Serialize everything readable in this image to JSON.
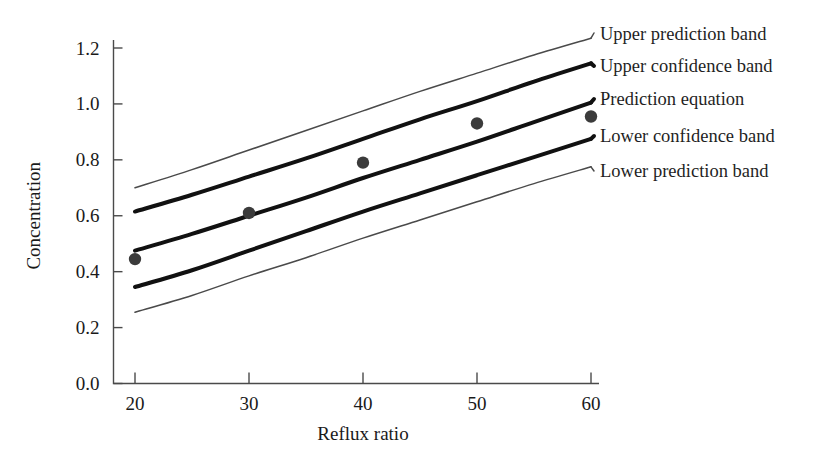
{
  "chart_data": {
    "type": "line",
    "title": "",
    "subtitle": "",
    "xlabel": "Reflux ratio",
    "ylabel": "Concentration",
    "xlim": [
      15,
      63
    ],
    "ylim": [
      0.0,
      1.28
    ],
    "xticks": [
      20,
      30,
      40,
      50,
      60
    ],
    "xtick_labels": [
      "20",
      "30",
      "40",
      "50",
      "60"
    ],
    "yticks": [
      0.0,
      0.2,
      0.4,
      0.6,
      0.8,
      1.0,
      1.2
    ],
    "ytick_labels": [
      "0.0",
      "0.2",
      "0.4",
      "0.6",
      "0.8",
      "1.0",
      "1.2"
    ],
    "grid": false,
    "legend_position": "right-outside",
    "x": [
      20,
      30,
      40,
      50,
      60
    ],
    "series": [
      {
        "name": "Upper prediction band",
        "style": "thin",
        "x": [
          20,
          25,
          30,
          35,
          40,
          45,
          50,
          55,
          60
        ],
        "values": [
          0.7,
          0.765,
          0.835,
          0.905,
          0.975,
          1.045,
          1.11,
          1.175,
          1.235
        ]
      },
      {
        "name": "Upper confidence band",
        "style": "thick",
        "x": [
          20,
          25,
          30,
          35,
          40,
          45,
          50,
          55,
          60
        ],
        "values": [
          0.615,
          0.675,
          0.74,
          0.805,
          0.875,
          0.945,
          1.01,
          1.08,
          1.145
        ]
      },
      {
        "name": "Prediction equation",
        "style": "thick",
        "x": [
          20,
          25,
          30,
          35,
          40,
          45,
          50,
          55,
          60
        ],
        "values": [
          0.475,
          0.535,
          0.6,
          0.665,
          0.735,
          0.8,
          0.865,
          0.935,
          1.005
        ]
      },
      {
        "name": "Lower confidence band",
        "style": "thick",
        "x": [
          20,
          25,
          30,
          35,
          40,
          45,
          50,
          55,
          60
        ],
        "values": [
          0.345,
          0.405,
          0.475,
          0.545,
          0.615,
          0.68,
          0.745,
          0.81,
          0.875
        ]
      },
      {
        "name": "Lower prediction band",
        "style": "thin",
        "x": [
          20,
          25,
          30,
          35,
          40,
          45,
          50,
          55,
          60
        ],
        "values": [
          0.255,
          0.315,
          0.385,
          0.45,
          0.52,
          0.585,
          0.65,
          0.715,
          0.775
        ]
      }
    ],
    "points": {
      "name": "Observed data",
      "x": [
        20,
        30,
        40,
        50,
        60
      ],
      "values": [
        0.445,
        0.61,
        0.79,
        0.93,
        0.955
      ]
    }
  },
  "legend": {
    "items": [
      {
        "label": "Upper prediction band"
      },
      {
        "label": "Upper confidence band"
      },
      {
        "label": "Prediction equation"
      },
      {
        "label": "Lower confidence band"
      },
      {
        "label": "Lower prediction band"
      }
    ]
  },
  "colors": {
    "background": "#ffffff",
    "axis": "#4a4a4a",
    "thin_line": "#4a4a4a",
    "thick_line": "#111111",
    "point": "#3b3b3b",
    "text": "#1a1a1a"
  }
}
